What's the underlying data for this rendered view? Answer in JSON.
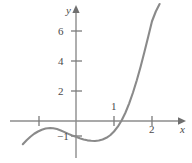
{
  "figure": {
    "background_color": "#ffffff",
    "axis_color": "#8c8c8c",
    "curve_color": "#8a8a8a",
    "label_color": "#4a4a4a",
    "x_axis_label": "x",
    "y_axis_label": "y"
  },
  "labels": {
    "y6": "6",
    "y4": "4",
    "y2": "2",
    "y_neg1": "−1",
    "x1": "1",
    "x2": "2"
  },
  "chart_data": {
    "type": "line",
    "title": "",
    "xlabel": "x",
    "ylabel": "y",
    "xlim": [
      -1.45,
      3.05
    ],
    "ylim": [
      -2.1,
      7.95
    ],
    "grid": false,
    "legend": null,
    "x_ticks": [
      -1,
      1,
      2
    ],
    "x_tick_labels": [
      "",
      "1",
      "2"
    ],
    "y_ticks": [
      -1,
      2,
      4,
      6
    ],
    "y_tick_labels": [
      "−1",
      "2",
      "4",
      "6"
    ],
    "axis_arrows": [
      "x-positive",
      "y-positive"
    ],
    "series": [
      {
        "name": "curve",
        "color": "#8a8a8a",
        "x": [
          -1.4,
          -1.3,
          -1.2,
          -1.1,
          -1.0,
          -0.9,
          -0.8,
          -0.68,
          -0.6,
          -0.5,
          -0.4,
          -0.3,
          -0.2,
          -0.1,
          0.0,
          0.1,
          0.2,
          0.3,
          0.4,
          0.5,
          0.6,
          0.7,
          0.8,
          0.9,
          1.0,
          1.1,
          1.2,
          1.3,
          1.4,
          1.5,
          1.6,
          1.7,
          1.8,
          1.9,
          2.0,
          2.1,
          2.2
        ],
        "y": [
          -1.55,
          -1.28,
          -1.05,
          -0.85,
          -0.7,
          -0.58,
          -0.5,
          -0.47,
          -0.48,
          -0.54,
          -0.63,
          -0.74,
          -0.86,
          -0.97,
          -1.05,
          -1.15,
          -1.23,
          -1.29,
          -1.32,
          -1.33,
          -1.3,
          -1.23,
          -1.12,
          -0.95,
          -0.7,
          -0.38,
          0.03,
          0.55,
          1.18,
          1.9,
          2.72,
          3.62,
          4.6,
          5.62,
          6.65,
          7.3,
          7.8
        ]
      }
    ],
    "features": {
      "local_maximum": {
        "x": -0.68,
        "y": -0.47
      },
      "local_minimum": {
        "x": 0.5,
        "y": -1.33
      },
      "x_intercept": {
        "x": 1.19,
        "y": 0
      },
      "y_intercept": {
        "x": 0,
        "y": -1.05
      }
    }
  }
}
